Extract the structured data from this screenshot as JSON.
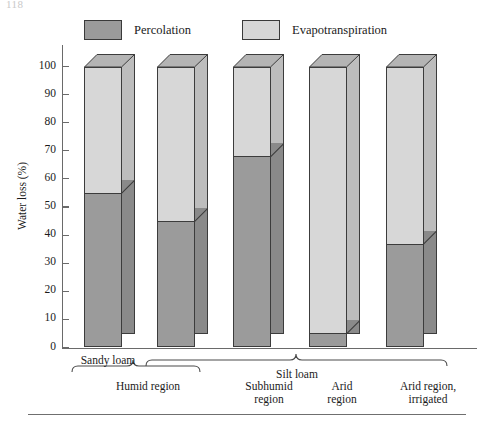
{
  "page": {
    "corner_text": "118"
  },
  "legend": {
    "items": [
      {
        "label": "Percolation",
        "color": "#9b9b9b",
        "name": "legend-percolation"
      },
      {
        "label": "Evapotranspiration",
        "color": "#d7d7d7",
        "name": "legend-evapotranspiration"
      }
    ]
  },
  "axis": {
    "ylabel": "Water loss (%)",
    "yticks": [
      "0",
      "10",
      "20",
      "30",
      "40",
      "50",
      "60",
      "70",
      "80",
      "90",
      "100"
    ]
  },
  "soil_groups": [
    {
      "label": "Sandy loam",
      "bars": [
        0
      ]
    },
    {
      "label": "Silt loam",
      "bars": [
        1,
        2,
        3,
        4
      ]
    }
  ],
  "region_groups": [
    {
      "label": "Humid region",
      "bars": [
        0,
        1
      ]
    }
  ],
  "bar_labels": [
    {
      "line1": "Subhumid",
      "line2": "region"
    },
    {
      "line1": "Arid",
      "line2": "region"
    },
    {
      "line1": "Arid region,",
      "line2": "irrigated"
    }
  ],
  "chart_data": {
    "type": "bar",
    "subtype": "stacked-3d-column",
    "title": "",
    "xlabel": "",
    "ylabel": "Water loss (%)",
    "ylim": [
      0,
      100
    ],
    "yticks": [
      0,
      10,
      20,
      30,
      40,
      50,
      60,
      70,
      80,
      90,
      100
    ],
    "grid": false,
    "legend_position": "top",
    "categories": [
      "Sandy loam / Humid region",
      "Silt loam / Humid region",
      "Silt loam / Subhumid region",
      "Silt loam / Arid region",
      "Silt loam / Arid region, irrigated"
    ],
    "series": [
      {
        "name": "Percolation",
        "color": "#9b9b9b",
        "values": [
          55,
          45,
          68,
          5,
          37
        ]
      },
      {
        "name": "Evapotranspiration",
        "color": "#d7d7d7",
        "values": [
          45,
          55,
          32,
          95,
          63
        ]
      }
    ],
    "totals": [
      100,
      100,
      100,
      100,
      100
    ]
  }
}
